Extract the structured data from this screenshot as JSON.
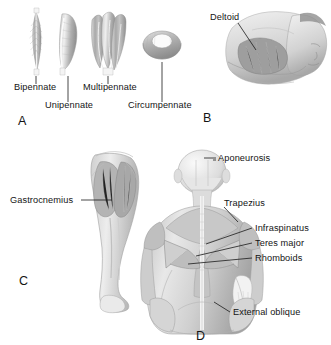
{
  "figure": {
    "background": "#ffffff",
    "ink_color": "#1a1a1a",
    "muscle_fill": "#b9b9b9"
  },
  "panels": [
    {
      "letter": "A",
      "name": "pennate-muscle-types",
      "labels": [
        {
          "text": "Bipennate",
          "x": 14,
          "y": 88
        },
        {
          "text": "Unipennate",
          "x": 45,
          "y": 106
        },
        {
          "text": "Multipennate",
          "x": 85,
          "y": 88
        },
        {
          "text": "Circumpennate",
          "x": 128,
          "y": 106
        }
      ],
      "letter_pos": {
        "x": 18,
        "y": 120
      }
    },
    {
      "letter": "B",
      "name": "deltoid-shoulder",
      "labels": [
        {
          "text": "Deltoid",
          "x": 212,
          "y": 17
        }
      ],
      "letter_pos": {
        "x": 203,
        "y": 118
      }
    },
    {
      "letter": "C",
      "name": "gastrocnemius-leg",
      "labels": [
        {
          "text": "Gastrocnemius",
          "x": 12,
          "y": 202
        }
      ],
      "letter_pos": {
        "x": 19,
        "y": 281
      }
    },
    {
      "letter": "D",
      "name": "back-musculature",
      "labels": [
        {
          "text": "Aponeurosis",
          "x": 218,
          "y": 160
        },
        {
          "text": "Trapezius",
          "x": 224,
          "y": 204
        },
        {
          "text": "Infraspinatus",
          "x": 254,
          "y": 230
        },
        {
          "text": "Teres major",
          "x": 254,
          "y": 245
        },
        {
          "text": "Rhomboids",
          "x": 254,
          "y": 260
        },
        {
          "text": "External oblique",
          "x": 232,
          "y": 315
        }
      ],
      "letter_pos": {
        "x": 196,
        "y": 336
      }
    }
  ]
}
